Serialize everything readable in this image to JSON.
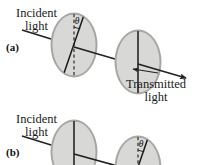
{
  "figure": {
    "panels": [
      {
        "id": "(a)",
        "labels": {
          "incident_line1": "Incident",
          "incident_line2": "light",
          "transmitted_line1": "Transmitted",
          "transmitted_line2": "light"
        },
        "angle_symbol": "θ",
        "angle_on_disc": 1,
        "discs": [
          {
            "index": 1,
            "axis": "tilted",
            "reference": "dashed-vertical"
          },
          {
            "index": 2,
            "axis": "vertical",
            "reference": "none"
          }
        ]
      },
      {
        "id": "(b)",
        "labels": {
          "incident_line1": "Incident",
          "incident_line2": "light"
        },
        "angle_symbol": "θ",
        "angle_on_disc": 2,
        "discs": [
          {
            "index": 1,
            "axis": "vertical",
            "reference": "none"
          },
          {
            "index": 2,
            "axis": "tilted",
            "reference": "dashed-vertical"
          }
        ]
      }
    ],
    "colors": {
      "disc_face": "#d8d8d6",
      "disc_rim": "#a9a9a6",
      "disc_rim_dark": "#8f8f8c",
      "axis_line": "#1a1a1a",
      "ray": "#222222",
      "text": "#1a1a1a",
      "background": "#ffffff"
    }
  }
}
